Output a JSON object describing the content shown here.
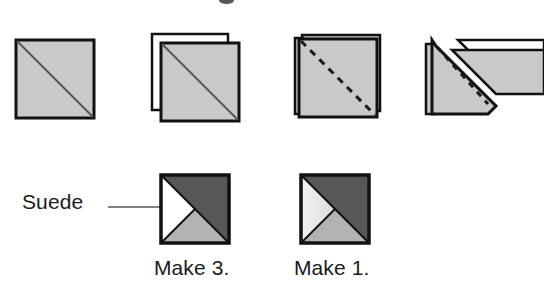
{
  "diagram": {
    "title_text": "",
    "type": "quilting-piecing-instruction-diagram",
    "palette": {
      "fabric_light_gray": "#c9c9c9",
      "fabric_medium_gray": "#b3b3b3",
      "fabric_dark_gray": "#575757",
      "fabric_white": "#ffffff",
      "fabric_pale": "#e8e8e8",
      "outline_black": "#111111",
      "leader_line_gray": "#808080",
      "text_color": "#1b1b1b",
      "background": "#ffffff"
    },
    "steps": [
      {
        "id": "step-1",
        "name": "single-square-with-diagonal",
        "description": "single light gray square with solid diagonal line"
      },
      {
        "id": "step-2",
        "name": "stacked-squares-right-sides-together",
        "description": "two squares layered, lower square light gray with solid diagonal"
      },
      {
        "id": "step-3",
        "name": "stacked-squares-stitch-line",
        "description": "layered squares with dashed stitching line on the diagonal"
      },
      {
        "id": "step-4",
        "name": "trimmed-triangle-units",
        "description": "triangle unit with dashed seam, trimmed corner pieces lifted away"
      }
    ],
    "callout": {
      "label": "Suede",
      "points_to": "white-left-triangle"
    },
    "units": [
      {
        "id": "unit-make-3",
        "caption": "Make 3.",
        "triangles": {
          "left": "#ffffff",
          "top_right": "#575757",
          "bottom": "#b3b3b3"
        },
        "has_callout_dot": true
      },
      {
        "id": "unit-make-1",
        "caption": "Make 1.",
        "triangles": {
          "left": "#e8e8e8",
          "top_right": "#575757",
          "bottom": "#b3b3b3"
        },
        "has_callout_dot": false
      }
    ]
  }
}
